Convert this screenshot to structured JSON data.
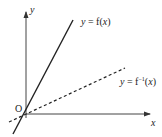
{
  "diagram": {
    "type": "function-and-inverse-graph",
    "axes": {
      "x_label": "x",
      "y_label": "y",
      "origin_label": "O"
    },
    "curves": [
      {
        "name": "f",
        "label_lhs": "y",
        "label_eq": " = ",
        "label_rhs": "f(",
        "label_var": "x",
        "label_close": ")",
        "style": "solid",
        "color": "#222222"
      },
      {
        "name": "f_inverse",
        "label_lhs": "y",
        "label_eq": " = ",
        "label_rhs": "f",
        "label_sup": "−1",
        "label_open": "(",
        "label_var": "x",
        "label_close": ")",
        "style": "dashed",
        "color": "#222222"
      }
    ],
    "colors": {
      "axis": "#444444",
      "line": "#222222",
      "background": "#ffffff"
    }
  }
}
